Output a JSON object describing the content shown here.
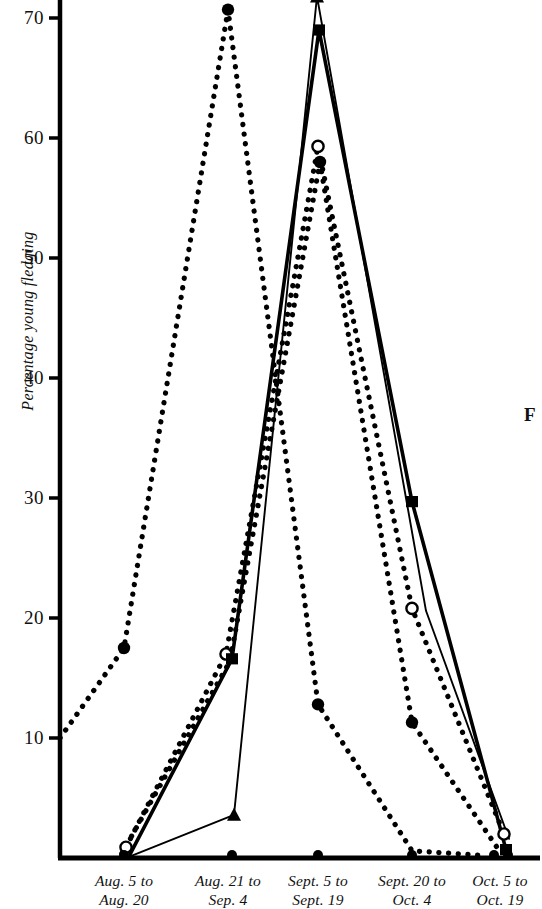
{
  "figure": {
    "caption_fragment": "F"
  },
  "axes": {
    "y_label": "Percentage young fledging",
    "y_ticks": [
      10,
      20,
      30,
      40,
      50,
      60,
      70
    ],
    "y_min": 0,
    "y_max": 72.5,
    "x_categories": [
      {
        "line1": "Aug. 5 to",
        "line2": "Aug. 20"
      },
      {
        "line1": "Aug. 21 to",
        "line2": "Sep. 4"
      },
      {
        "line1": "Sept. 5 to",
        "line2": "Sept. 19"
      },
      {
        "line1": "Sept. 20 to",
        "line2": "Oct. 4"
      },
      {
        "line1": "Oct. 5 to",
        "line2": "Oct. 19"
      }
    ],
    "axis_color": "#000000"
  },
  "chart_data": {
    "type": "line",
    "title": "",
    "xlabel": "",
    "ylabel": "Percentage young fledging",
    "ylim": [
      0,
      72.5
    ],
    "grid": false,
    "legend": "none",
    "categories": [
      "Aug. 5 to Aug. 20",
      "Aug. 21 to Sep. 4",
      "Sept. 5 to Sept. 19",
      "Sept. 20 to Oct. 4",
      "Oct. 5 to Oct. 19"
    ],
    "series": [
      {
        "name": "Series A",
        "style": "dotted",
        "marker": "filled-circle",
        "origin_value": 10,
        "values": [
          17.5,
          70.7,
          12.8,
          0.6,
          0.2
        ]
      },
      {
        "name": "Series B",
        "style": "dotted",
        "marker": "open-circle",
        "values": [
          0.9,
          17.0,
          59.3,
          20.8,
          2.0
        ]
      },
      {
        "name": "Series C",
        "style": "dotted",
        "marker": "filled-circle",
        "values": [
          0.4,
          16.4,
          58.0,
          11.3,
          0.4
        ]
      },
      {
        "name": "Series D",
        "style": "solid-thick",
        "marker": "filled-square",
        "values": [
          0.3,
          16.6,
          69.0,
          29.7,
          0.7
        ]
      },
      {
        "name": "Series E",
        "style": "solid-thin",
        "marker": "filled-triangle",
        "values": [
          0.2,
          3.6,
          71.8,
          20.6,
          1.6
        ]
      }
    ]
  }
}
